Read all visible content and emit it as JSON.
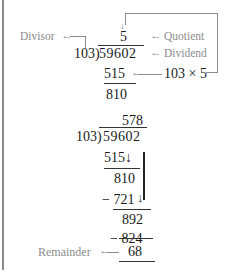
{
  "example1": {
    "labels": {
      "divisor": "Divisor",
      "quotient": "Quotient",
      "dividend": "Dividend",
      "product": "103 × 5"
    },
    "divisor": "103)",
    "quotient": "5",
    "dividend": "59602",
    "subtract": "515",
    "result": "810",
    "arrow_left": "←"
  },
  "example2": {
    "quotient": "578",
    "divisor": "103)",
    "dividend": "59602",
    "steps": [
      {
        "subtract": "515↓",
        "result": "810"
      },
      {
        "subtract": "− 721",
        "result": "892"
      },
      {
        "subtract": "− 824",
        "result": "68"
      }
    ],
    "labels": {
      "remainder": "Remainder"
    }
  }
}
